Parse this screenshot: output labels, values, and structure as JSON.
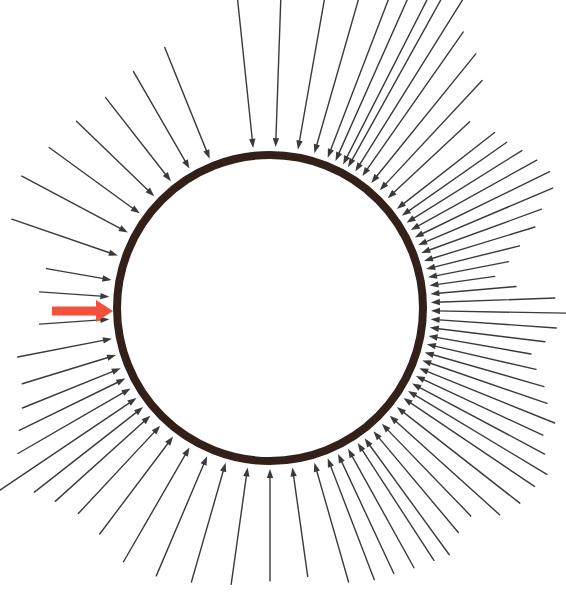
{
  "figure": {
    "background_color": "#ffffff",
    "width": 566,
    "height": 596
  },
  "circle": {
    "name": "boundary-circle",
    "center_x": 270,
    "center_y": 308,
    "radius": 153,
    "stroke_color": "#332019",
    "stroke_width": 8,
    "fill": "none"
  },
  "arrow_style": {
    "stroke_color": "#3a3a3a",
    "stroke_width": 1.4,
    "head_length": 9,
    "head_half_width": 3.2,
    "gap_from_circle": 4
  },
  "highlight_arrow": {
    "name": "highlighted-red-arrow",
    "color": "#f4513c",
    "x_start": 52,
    "x_end": 113,
    "y": 311,
    "shaft_thickness": 9,
    "head_length": 17,
    "head_half_width": 11
  },
  "chart_data": {
    "type": "scatter",
    "subtitle": "",
    "xlabel": "",
    "ylabel": "",
    "grid": false,
    "legend": "none",
    "xlim": [
      0,
      566
    ],
    "ylim": [
      0,
      596
    ],
    "annotations": [
      "One arrow on the left side is drawn in red and is thicker than all others",
      "A gap with no arrows spans the upper-right sector of the circle"
    ],
    "series": [
      {
        "name": "inward-arrows",
        "description": "Thin black arrows pointing inward, tips terminating on the circle perimeter. Each entry is [angle_degrees_measured_ccw_from_east, tail_length_pixels].",
        "values": [
          [
            96,
            240
          ],
          [
            88,
            206
          ],
          [
            80,
            186
          ],
          [
            74,
            164
          ],
          [
            69,
            190
          ],
          [
            66,
            196
          ],
          [
            63,
            204
          ],
          [
            61,
            210
          ],
          [
            58,
            214
          ],
          [
            55,
            176
          ],
          [
            51,
            166
          ],
          [
            47,
            150
          ],
          [
            43,
            112
          ],
          [
            112,
            120
          ],
          [
            120,
            112
          ],
          [
            128,
            106
          ],
          [
            136,
            108
          ],
          [
            144,
            112
          ],
          [
            152,
            120
          ],
          [
            161,
            112
          ],
          [
            170,
            66
          ],
          [
            176,
            70
          ],
          [
            184,
            70
          ],
          [
            191,
            96
          ],
          [
            197,
            98
          ],
          [
            202,
            106
          ],
          [
            206,
            118
          ],
          [
            210,
            130
          ],
          [
            214,
            176
          ],
          [
            218,
            138
          ],
          [
            222,
            128
          ],
          [
            227,
            120
          ],
          [
            233,
            122
          ],
          [
            240,
            132
          ],
          [
            247,
            130
          ],
          [
            254,
            124
          ],
          [
            262,
            118
          ],
          [
            270,
            112
          ],
          [
            278,
            110
          ],
          [
            286,
            124
          ],
          [
            291,
            130
          ],
          [
            295,
            132
          ],
          [
            299,
            136
          ],
          [
            303,
            140
          ],
          [
            306,
            144
          ],
          [
            310,
            132
          ],
          [
            314,
            128
          ],
          [
            318,
            148
          ],
          [
            322,
            156
          ],
          [
            326,
            158
          ],
          [
            329,
            162
          ],
          [
            332,
            150
          ],
          [
            335,
            140
          ],
          [
            338,
            146
          ],
          [
            341,
            132
          ],
          [
            344,
            124
          ],
          [
            347,
            112
          ],
          [
            350,
            104
          ],
          [
            353,
            116
          ],
          [
            356,
            126
          ],
          [
            359,
            136
          ],
          [
            2,
            124
          ],
          [
            5,
            86
          ],
          [
            8,
            66
          ],
          [
            11,
            82
          ],
          [
            14,
            96
          ],
          [
            17,
            116
          ],
          [
            20,
            128
          ],
          [
            23,
            146
          ],
          [
            26,
            150
          ],
          [
            29,
            144
          ],
          [
            32,
            136
          ],
          [
            35,
            128
          ],
          [
            38,
            124
          ]
        ]
      },
      {
        "name": "highlight-arrow",
        "description": "Single thick red arrow pointing inward from the left. [angle_degrees, tail_length_pixels]",
        "values": [
          [
            180,
            62
          ]
        ]
      }
    ]
  }
}
